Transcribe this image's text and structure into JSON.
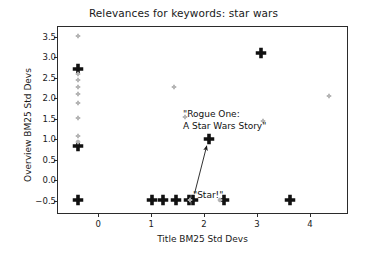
{
  "chart_data": {
    "type": "scatter",
    "title": "Relevances for keywords: star wars",
    "xlabel": "Title BM25 Std Devs",
    "ylabel": "Overview BM25 Std Devs",
    "xlim": [
      -0.78,
      4.72
    ],
    "ylim": [
      -0.82,
      3.76
    ],
    "xticks": [
      0,
      1,
      2,
      3,
      4
    ],
    "xticklabels": [
      "0",
      "1",
      "2",
      "3",
      "4"
    ],
    "yticks": [
      -0.5,
      0.0,
      0.5,
      1.0,
      1.5,
      2.0,
      2.5,
      3.0,
      3.5
    ],
    "yticklabels": [
      "−0.5",
      "0.0",
      "0.5",
      "1.0",
      "1.5",
      "2.0",
      "2.5",
      "3.0",
      "3.5"
    ],
    "grid": false,
    "legend": null,
    "marker": "plus",
    "series": [
      {
        "name": "highlighted",
        "color": "#111111",
        "size": "large",
        "points": [
          {
            "x": -0.41,
            "y": 0.87
          },
          {
            "x": -0.41,
            "y": -0.45
          },
          {
            "x": 1.0,
            "y": -0.45
          },
          {
            "x": 1.2,
            "y": -0.45
          },
          {
            "x": 1.45,
            "y": -0.45
          },
          {
            "x": 1.69,
            "y": -0.45
          },
          {
            "x": 1.78,
            "y": -0.45
          },
          {
            "x": 2.35,
            "y": -0.45
          },
          {
            "x": 3.6,
            "y": -0.45
          },
          {
            "x": 2.08,
            "y": 1.02
          },
          {
            "x": 3.05,
            "y": 3.13
          },
          {
            "x": -0.41,
            "y": 2.73
          }
        ]
      },
      {
        "name": "background",
        "color": "#b5b5b5",
        "size": "small",
        "points": [
          {
            "x": -0.41,
            "y": 3.55
          },
          {
            "x": -0.41,
            "y": 2.62
          },
          {
            "x": -0.41,
            "y": 2.48
          },
          {
            "x": -0.41,
            "y": 2.3
          },
          {
            "x": -0.41,
            "y": 2.12
          },
          {
            "x": -0.41,
            "y": 1.92
          },
          {
            "x": -0.41,
            "y": 1.55
          },
          {
            "x": -0.41,
            "y": 1.1
          },
          {
            "x": -0.41,
            "y": 0.95
          },
          {
            "x": 2.28,
            "y": -0.45
          },
          {
            "x": 1.72,
            "y": -0.45
          },
          {
            "x": 4.35,
            "y": 2.08
          },
          {
            "x": 3.1,
            "y": 1.46
          },
          {
            "x": 1.62,
            "y": 1.56
          },
          {
            "x": 1.42,
            "y": 2.3
          }
        ]
      }
    ],
    "annotations": [
      {
        "name": "rogue-one-label",
        "text": "\"Rogue One:\nA Star Wars Story\"",
        "x": 2.08,
        "y": 1.02
      },
      {
        "name": "star-label",
        "text": "\"Star!\"",
        "x": 1.82,
        "y": -0.32,
        "arrow_to": {
          "x": 2.05,
          "y": 0.84
        }
      }
    ]
  }
}
